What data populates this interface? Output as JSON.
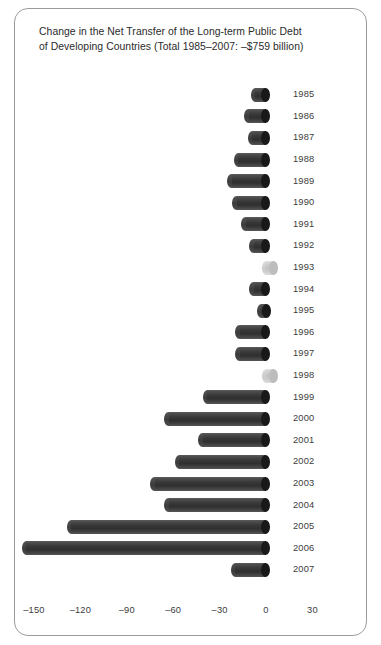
{
  "chart_data": {
    "type": "bar",
    "orientation": "horizontal",
    "title": "Change in the Net Transfer of the Long-term Public Debt of Developing Countries (Total 1985–2007: –$759 billion)",
    "title_lines": [
      "Change in the Net Transfer of the Long-term Public Debt",
      "of Developing Countries (Total 1985–2007: –$759 billion)"
    ],
    "xlabel": "",
    "ylabel": "",
    "xlim": [
      -165,
      38
    ],
    "xticks": [
      -150,
      -120,
      -90,
      -60,
      -30,
      0,
      30
    ],
    "xtick_labels": [
      "–150",
      "–120",
      "–90",
      "–60",
      "–30",
      "0",
      "30"
    ],
    "units": "billions of US dollars",
    "grid": false,
    "legend": false,
    "categories": [
      "1985",
      "1986",
      "1987",
      "1988",
      "1989",
      "1990",
      "1991",
      "1992",
      "1993",
      "1994",
      "1995",
      "1996",
      "1997",
      "1998",
      "1999",
      "2000",
      "2001",
      "2002",
      "2003",
      "2004",
      "2005",
      "2006",
      "2007"
    ],
    "values": [
      -7,
      -11,
      -9,
      -18,
      -22,
      -19,
      -13,
      -8,
      5,
      -8,
      -3,
      -17,
      -17,
      5,
      -38,
      -63,
      -41,
      -56,
      -72,
      -63,
      -126,
      -155,
      -20
    ],
    "bars": [
      {
        "year": "1985",
        "value": -7,
        "sign": "negative"
      },
      {
        "year": "1986",
        "value": -11,
        "sign": "negative"
      },
      {
        "year": "1987",
        "value": -9,
        "sign": "negative"
      },
      {
        "year": "1988",
        "value": -18,
        "sign": "negative"
      },
      {
        "year": "1989",
        "value": -22,
        "sign": "negative"
      },
      {
        "year": "1990",
        "value": -19,
        "sign": "negative"
      },
      {
        "year": "1991",
        "value": -13,
        "sign": "negative"
      },
      {
        "year": "1992",
        "value": -8,
        "sign": "negative"
      },
      {
        "year": "1993",
        "value": 5,
        "sign": "positive"
      },
      {
        "year": "1994",
        "value": -8,
        "sign": "negative"
      },
      {
        "year": "1995",
        "value": -3,
        "sign": "negative"
      },
      {
        "year": "1996",
        "value": -17,
        "sign": "negative"
      },
      {
        "year": "1997",
        "value": -17,
        "sign": "negative"
      },
      {
        "year": "1998",
        "value": 5,
        "sign": "positive"
      },
      {
        "year": "1999",
        "value": -38,
        "sign": "negative"
      },
      {
        "year": "2000",
        "value": -63,
        "sign": "negative"
      },
      {
        "year": "2001",
        "value": -41,
        "sign": "negative"
      },
      {
        "year": "2002",
        "value": -56,
        "sign": "negative"
      },
      {
        "year": "2003",
        "value": -72,
        "sign": "negative"
      },
      {
        "year": "2004",
        "value": -63,
        "sign": "negative"
      },
      {
        "year": "2005",
        "value": -126,
        "sign": "negative"
      },
      {
        "year": "2006",
        "value": -155,
        "sign": "negative"
      },
      {
        "year": "2007",
        "value": -20,
        "sign": "negative"
      }
    ],
    "colors": {
      "negative_bar": "#383838",
      "negative_cap": "#191919",
      "positive_bar": "#c9c9c9",
      "positive_cap": "#bdbdbd",
      "text": "#3c3c3c",
      "frame": "#9b9b9b",
      "background": "#ffffff"
    }
  }
}
